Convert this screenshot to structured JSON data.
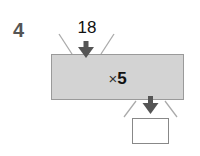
{
  "question": {
    "number": "4"
  },
  "machine": {
    "input": "18",
    "operator_symbol": "×",
    "operand": "5",
    "output": ""
  },
  "colors": {
    "machine_fill": "#d3d3d3",
    "arrow": "#555555",
    "funnel_lines": "#aaaaaa"
  }
}
